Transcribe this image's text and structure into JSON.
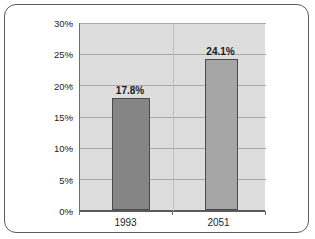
{
  "chart_data": {
    "type": "bar",
    "title": "",
    "xlabel": "",
    "ylabel": "",
    "categories": [
      "1993",
      "2051"
    ],
    "values": [
      17.8,
      24.1
    ],
    "data_labels": [
      "17.8%",
      "24.1%"
    ],
    "ylim": [
      0,
      30
    ],
    "ytick_values": [
      0,
      5,
      10,
      15,
      20,
      25,
      30
    ],
    "ytick_labels": [
      "0%",
      "5%",
      "10%",
      "15%",
      "20%",
      "25%",
      "30%"
    ],
    "grid": true,
    "legend": null,
    "series": [
      {
        "name": "",
        "values": [
          17.8,
          24.1
        ]
      }
    ],
    "colors": {
      "bar_1993": "#858585",
      "bar_2051": "#a6a6a6",
      "bar_border": "#4a4a4a",
      "plot_background": "#dddddd",
      "gridline": "#a9a9a9",
      "axis": "#5a5a5a",
      "frame_border": "#5b5b5b",
      "text": "#262626"
    }
  }
}
